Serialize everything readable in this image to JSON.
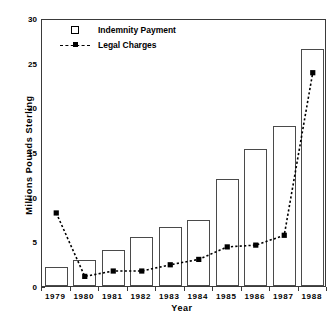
{
  "chart_data": {
    "type": "bar",
    "title": "",
    "xlabel": "Year",
    "ylabel": "Millions  Pounds  Sterling",
    "categories": [
      "1979",
      "1980",
      "1981",
      "1982",
      "1983",
      "1984",
      "1985",
      "1986",
      "1987",
      "1988"
    ],
    "ylim": [
      0,
      30
    ],
    "yticks": [
      0,
      5,
      10,
      15,
      20,
      25,
      30
    ],
    "ytick_labels": [
      "0",
      "5",
      "10",
      "15",
      "20",
      "25",
      "30"
    ],
    "grid": false,
    "legend_position": "upper-left-inside",
    "series": [
      {
        "name": "Indemnity Payment",
        "type": "bar",
        "values": [
          2.1,
          2.9,
          4.0,
          5.5,
          6.6,
          7.4,
          12.0,
          15.3,
          17.9,
          26.5
        ]
      },
      {
        "name": "Legal Charges",
        "type": "line",
        "values": [
          8.4,
          1.3,
          1.9,
          1.9,
          2.6,
          3.2,
          4.6,
          4.8,
          5.9,
          24.1
        ]
      }
    ]
  },
  "legend": {
    "items": [
      {
        "label": "Indemnity Payment",
        "marker": "open-square"
      },
      {
        "label": "Legal Charges",
        "marker": "dashed-line-filled-square"
      }
    ]
  },
  "colors": {
    "bar_edge": "#4a4a4a",
    "axis": "#3a3a3a",
    "line": "#000000",
    "background": "#ffffff"
  }
}
